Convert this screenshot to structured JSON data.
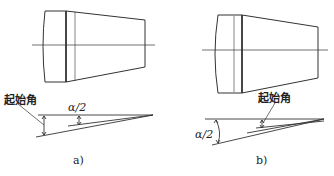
{
  "figure_a": {
    "start_angle_label": "起始角",
    "half_angle_label": "α/2",
    "caption": "a)"
  },
  "figure_b": {
    "start_angle_label": "起始角",
    "half_angle_label": "α/2",
    "caption": "b)"
  },
  "colors": {
    "line": "#333333",
    "background": "#ffffff"
  }
}
